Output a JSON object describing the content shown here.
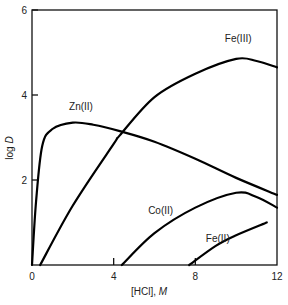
{
  "chart_data": {
    "type": "line",
    "title": "",
    "xlabel": "[HCl], M",
    "ylabel": "log D",
    "xlim": [
      0,
      12
    ],
    "ylim": [
      0,
      6
    ],
    "xticks": [
      0,
      4,
      8,
      12
    ],
    "yticks": [
      2,
      4,
      6
    ],
    "x_tick_labels": [
      "0",
      "4",
      "8",
      "12"
    ],
    "y_tick_labels": [
      "2",
      "4",
      "6"
    ],
    "grid": false,
    "legend": "inline labels on curves",
    "series": [
      {
        "name": "Zn(II)",
        "label_pos": [
          2.4,
          3.65
        ],
        "points": [
          [
            0,
            0
          ],
          [
            0.2,
            1.5
          ],
          [
            0.5,
            2.8
          ],
          [
            1,
            3.2
          ],
          [
            2,
            3.35
          ],
          [
            3,
            3.3
          ],
          [
            4.3,
            3.15
          ],
          [
            6,
            2.9
          ],
          [
            8,
            2.5
          ],
          [
            10,
            2.05
          ],
          [
            12,
            1.65
          ]
        ]
      },
      {
        "name": "Fe(III)",
        "label_pos": [
          10.1,
          5.25
        ],
        "points": [
          [
            0.4,
            0
          ],
          [
            2,
            1.4
          ],
          [
            4,
            2.85
          ],
          [
            4.3,
            3.05
          ],
          [
            6,
            3.95
          ],
          [
            8,
            4.5
          ],
          [
            10,
            4.85
          ],
          [
            11,
            4.8
          ],
          [
            12,
            4.65
          ]
        ]
      },
      {
        "name": "Co(II)",
        "label_pos": [
          6.3,
          1.2
        ],
        "points": [
          [
            4.4,
            0
          ],
          [
            6,
            0.75
          ],
          [
            8,
            1.35
          ],
          [
            10,
            1.7
          ],
          [
            11,
            1.6
          ],
          [
            12,
            1.35
          ]
        ]
      },
      {
        "name": "Fe(II)",
        "label_pos": [
          9.1,
          0.55
        ],
        "points": [
          [
            7.7,
            0
          ],
          [
            9,
            0.45
          ],
          [
            10,
            0.7
          ],
          [
            11.5,
            1.0
          ]
        ]
      }
    ]
  },
  "labels": {
    "x_axis": "[HCl], ",
    "x_axis_unit": "M",
    "y_axis": "log ",
    "y_axis_var": "D"
  }
}
